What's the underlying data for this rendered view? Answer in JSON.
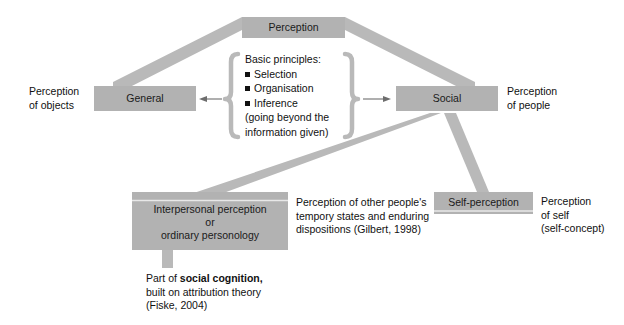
{
  "diagram": {
    "colors": {
      "box_fill": "#b2b2b2",
      "band_fill": "#b9b9b9",
      "bracket_fill": "#b9b9b9",
      "text": "#111111",
      "background": "#ffffff"
    },
    "nodes": {
      "perception": {
        "label": "Perception"
      },
      "general": {
        "label": "General"
      },
      "social": {
        "label": "Social"
      },
      "interpersonal": {
        "line1": "Interpersonal perception",
        "line2": "or",
        "line3": "ordinary personology"
      },
      "self_perception": {
        "label": "Self-perception"
      }
    },
    "side_labels": {
      "objects": {
        "line1": "Perception",
        "line2": "of objects"
      },
      "people": {
        "line1": "Perception",
        "line2": "of people"
      },
      "self": {
        "line1": "Perception",
        "line2": "of self",
        "line3": "(self-concept)"
      }
    },
    "principles": {
      "heading": "Basic principles:",
      "items": [
        "Selection",
        "Organisation",
        "Inference"
      ],
      "parenthetical_line1": "(going beyond the",
      "parenthetical_line2": "information given)"
    },
    "annotations": {
      "interpersonal_note": {
        "line1": "Perception of other people's",
        "line2": "tempory states and enduring",
        "line3": "dispositions  (Gilbert, 1998)"
      },
      "social_cognition_note": {
        "line1_prefix": "Part of ",
        "line1_bold": "social cognition,",
        "line2": "built on attribution theory",
        "line3": "(Fiske, 2004)"
      }
    },
    "icons": {
      "arrow_left": "arrow-left-icon",
      "arrow_right": "arrow-right-icon",
      "brace_left": "left-curly-brace-icon",
      "brace_right": "right-curly-brace-icon"
    }
  }
}
